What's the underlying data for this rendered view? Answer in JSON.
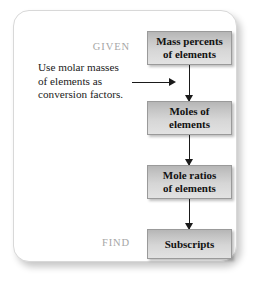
{
  "figure": {
    "given_label": "GIVEN",
    "find_label": "FIND",
    "note_lines": [
      "Use molar masses",
      "of elements as",
      "conversion factors."
    ],
    "steps": [
      {
        "line1": "Mass percents",
        "line2": "of elements"
      },
      {
        "line1": "Moles of",
        "line2": "elements"
      },
      {
        "line1": "Mole ratios",
        "line2": "of elements"
      },
      {
        "line1": "Subscripts",
        "line2": ""
      }
    ],
    "colors": {
      "box_fill_top": "#b6b6b6",
      "box_fill_bottom": "#e2e2e2",
      "box_border": "#9a9a9a",
      "arrow": "#1a1a1a",
      "label_gray": "#a6a6a6",
      "panel_border": "#d8d8d8",
      "text": "#111111",
      "background": "#ffffff"
    }
  }
}
